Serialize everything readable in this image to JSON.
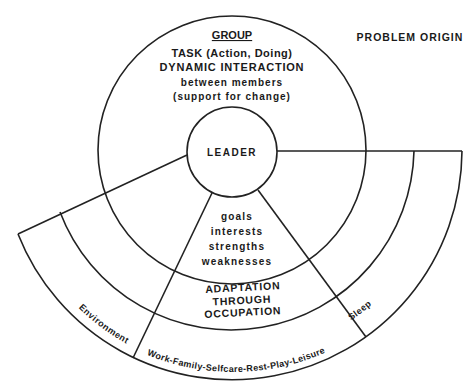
{
  "diagram": {
    "corner_label": "PROBLEM ORIGIN",
    "group": {
      "title": "GROUP",
      "lines": [
        "TASK (Action, Doing)",
        "DYNAMIC INTERACTION",
        "between members",
        "(support for change)"
      ]
    },
    "leader": "LEADER",
    "individual": [
      "goals",
      "interests",
      "strengths",
      "weaknesses"
    ],
    "adaptation": [
      "ADAPTATION",
      "THROUGH",
      "OCCUPATION"
    ],
    "occupations": "Work-Family-Selfcare-Rest-Play-Leisure",
    "environment": "Environment",
    "sleep": "Sleep",
    "colors": {
      "line": "#222222",
      "text": "#1a1a1a",
      "background": "#ffffff"
    }
  }
}
